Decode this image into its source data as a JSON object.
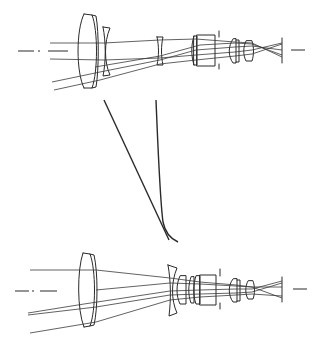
{
  "diagram": {
    "type": "optical-zoom-lens-layout",
    "line_color": "#2a2a2a",
    "background": "#ffffff",
    "configurations": [
      {
        "id": "wide",
        "position": "top",
        "label": ""
      },
      {
        "id": "tele",
        "position": "bottom",
        "label": ""
      }
    ],
    "movement_curves": [
      {
        "id": "group1-trajectory",
        "shape": "straight"
      },
      {
        "id": "group2-trajectory",
        "shape": "curved"
      }
    ]
  }
}
